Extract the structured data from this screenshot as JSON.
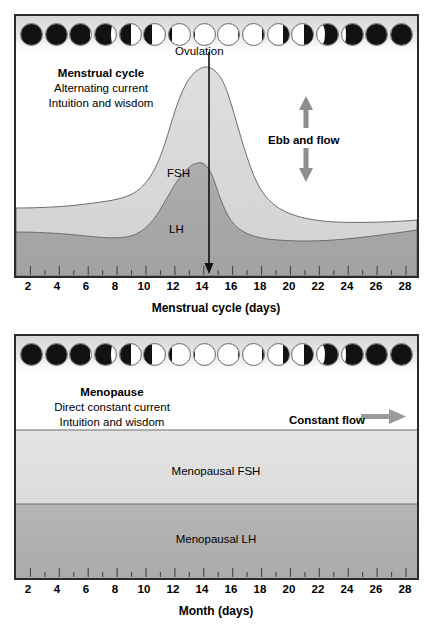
{
  "chart_data": [
    {
      "type": "area",
      "id": "menstrual-cycle",
      "title": "Menstrual cycle",
      "subtitle_lines": [
        "Alternating current",
        "Intuition and wisdom"
      ],
      "xlabel": "Menstrual cycle (days)",
      "ylabel": "",
      "xlim": [
        1,
        28
      ],
      "xticks": [
        2,
        4,
        6,
        8,
        10,
        12,
        14,
        16,
        18,
        20,
        22,
        24,
        26,
        28
      ],
      "grid": false,
      "legend_position": "inline-annotation",
      "annotations": [
        {
          "text": "Ovulation",
          "x": 14,
          "note": "vertical arrow down to axis at day 14"
        },
        {
          "text": "Ebb and flow",
          "note": "double-headed vertical arrow, up and down"
        },
        {
          "text": "FSH",
          "series": "FSH"
        },
        {
          "text": "LH",
          "series": "LH"
        }
      ],
      "series": [
        {
          "name": "FSH",
          "color": "#d9d9d9",
          "x": [
            1,
            2,
            3,
            4,
            5,
            6,
            7,
            8,
            9,
            10,
            11,
            12,
            13,
            14,
            15,
            16,
            17,
            18,
            19,
            20,
            21,
            22,
            23,
            24,
            25,
            26,
            27,
            28
          ],
          "values": [
            30,
            30,
            30,
            30,
            30,
            30,
            31,
            32,
            34,
            40,
            55,
            76,
            92,
            96,
            88,
            68,
            50,
            41,
            36,
            33,
            31,
            30,
            29,
            29,
            28,
            28,
            29,
            30
          ]
        },
        {
          "name": "LH",
          "color": "#a8a8a8",
          "x": [
            1,
            2,
            3,
            4,
            5,
            6,
            7,
            8,
            9,
            10,
            11,
            12,
            13,
            14,
            15,
            16,
            17,
            18,
            19,
            20,
            21,
            22,
            23,
            24,
            25,
            26,
            27,
            28
          ],
          "values": [
            17,
            17,
            17,
            17,
            16,
            16,
            15,
            14,
            14,
            16,
            21,
            32,
            44,
            43,
            32,
            24,
            20,
            18,
            17,
            16,
            16,
            16,
            17,
            17,
            18,
            19,
            21,
            23
          ]
        }
      ],
      "moon_phases": [
        {
          "index": 1,
          "name": "new-moon",
          "illumination": 0.0,
          "waxing": true
        },
        {
          "index": 2,
          "name": "new-moon",
          "illumination": 0.02,
          "waxing": true
        },
        {
          "index": 3,
          "name": "waxing-crescent",
          "illumination": 0.1,
          "waxing": true
        },
        {
          "index": 4,
          "name": "waxing-crescent",
          "illumination": 0.28,
          "waxing": true
        },
        {
          "index": 5,
          "name": "first-quarter",
          "illumination": 0.5,
          "waxing": true
        },
        {
          "index": 6,
          "name": "waxing-gibbous",
          "illumination": 0.7,
          "waxing": true
        },
        {
          "index": 7,
          "name": "waxing-gibbous",
          "illumination": 0.88,
          "waxing": true
        },
        {
          "index": 8,
          "name": "full-moon",
          "illumination": 1.0,
          "waxing": true
        },
        {
          "index": 9,
          "name": "full-moon",
          "illumination": 1.0,
          "waxing": false
        },
        {
          "index": 10,
          "name": "waning-gibbous",
          "illumination": 0.95,
          "waxing": false
        },
        {
          "index": 11,
          "name": "waning-gibbous",
          "illumination": 0.8,
          "waxing": false
        },
        {
          "index": 12,
          "name": "waning-gibbous",
          "illumination": 0.62,
          "waxing": false
        },
        {
          "index": 13,
          "name": "last-quarter",
          "illumination": 0.45,
          "waxing": false
        },
        {
          "index": 14,
          "name": "waning-crescent",
          "illumination": 0.25,
          "waxing": false
        },
        {
          "index": 15,
          "name": "new-moon",
          "illumination": 0.04,
          "waxing": false
        },
        {
          "index": 16,
          "name": "new-moon",
          "illumination": 0.0,
          "waxing": false
        }
      ]
    },
    {
      "type": "area",
      "id": "menopause",
      "title": "Menopause",
      "subtitle_lines": [
        "Direct constant current",
        "Intuition and wisdom"
      ],
      "xlabel": "Month (days)",
      "ylabel": "",
      "xlim": [
        1,
        28
      ],
      "xticks": [
        2,
        4,
        6,
        8,
        10,
        12,
        14,
        16,
        18,
        20,
        22,
        24,
        26,
        28
      ],
      "grid": false,
      "legend_position": "inline-annotation",
      "annotations": [
        {
          "text": "Constant flow",
          "note": "horizontal right-pointing arrow"
        },
        {
          "text": "Menopausal FSH",
          "series": "Menopausal FSH"
        },
        {
          "text": "Menopausal LH",
          "series": "Menopausal LH"
        }
      ],
      "series": [
        {
          "name": "Menopausal FSH",
          "color": "#e0e0e0",
          "constant": 72,
          "x": [
            1,
            2,
            3,
            4,
            5,
            6,
            7,
            8,
            9,
            10,
            11,
            12,
            13,
            14,
            15,
            16,
            17,
            18,
            19,
            20,
            21,
            22,
            23,
            24,
            25,
            26,
            27,
            28
          ],
          "values": [
            72,
            72,
            72,
            72,
            72,
            72,
            72,
            72,
            72,
            72,
            72,
            72,
            72,
            72,
            72,
            72,
            72,
            72,
            72,
            72,
            72,
            72,
            72,
            72,
            72,
            72,
            72,
            72
          ]
        },
        {
          "name": "Menopausal LH",
          "color": "#b0b0b0",
          "constant": 38,
          "x": [
            1,
            2,
            3,
            4,
            5,
            6,
            7,
            8,
            9,
            10,
            11,
            12,
            13,
            14,
            15,
            16,
            17,
            18,
            19,
            20,
            21,
            22,
            23,
            24,
            25,
            26,
            27,
            28
          ],
          "values": [
            38,
            38,
            38,
            38,
            38,
            38,
            38,
            38,
            38,
            38,
            38,
            38,
            38,
            38,
            38,
            38,
            38,
            38,
            38,
            38,
            38,
            38,
            38,
            38,
            38,
            38,
            38,
            38
          ]
        }
      ],
      "moon_phases": [
        {
          "index": 1,
          "name": "new-moon",
          "illumination": 0.0,
          "waxing": true
        },
        {
          "index": 2,
          "name": "new-moon",
          "illumination": 0.02,
          "waxing": true
        },
        {
          "index": 3,
          "name": "waxing-crescent",
          "illumination": 0.1,
          "waxing": true
        },
        {
          "index": 4,
          "name": "waxing-crescent",
          "illumination": 0.28,
          "waxing": true
        },
        {
          "index": 5,
          "name": "first-quarter",
          "illumination": 0.5,
          "waxing": true
        },
        {
          "index": 6,
          "name": "waxing-gibbous",
          "illumination": 0.7,
          "waxing": true
        },
        {
          "index": 7,
          "name": "waxing-gibbous",
          "illumination": 0.88,
          "waxing": true
        },
        {
          "index": 8,
          "name": "full-moon",
          "illumination": 1.0,
          "waxing": true
        },
        {
          "index": 9,
          "name": "full-moon",
          "illumination": 1.0,
          "waxing": false
        },
        {
          "index": 10,
          "name": "waning-gibbous",
          "illumination": 0.95,
          "waxing": false
        },
        {
          "index": 11,
          "name": "waning-gibbous",
          "illumination": 0.8,
          "waxing": false
        },
        {
          "index": 12,
          "name": "waning-gibbous",
          "illumination": 0.62,
          "waxing": false
        },
        {
          "index": 13,
          "name": "last-quarter",
          "illumination": 0.45,
          "waxing": false
        },
        {
          "index": 14,
          "name": "waning-crescent",
          "illumination": 0.25,
          "waxing": false
        },
        {
          "index": 15,
          "name": "new-moon",
          "illumination": 0.04,
          "waxing": false
        },
        {
          "index": 16,
          "name": "new-moon",
          "illumination": 0.0,
          "waxing": false
        }
      ]
    }
  ],
  "cycle_panel": {
    "caption_title": "Menstrual cycle",
    "caption_line2": "Alternating current",
    "caption_line3": "Intuition and wisdom",
    "ovulation_label": "Ovulation",
    "ebb_label": "Ebb and flow",
    "fsh_label": "FSH",
    "lh_label": "LH",
    "axis_title": "Menstrual cycle (days)",
    "axis_ticks": [
      "2",
      "4",
      "6",
      "8",
      "10",
      "12",
      "14",
      "16",
      "18",
      "20",
      "22",
      "24",
      "26",
      "28"
    ]
  },
  "menopause_panel": {
    "caption_title": "Menopause",
    "caption_line2": "Direct constant current",
    "caption_line3": "Intuition and wisdom",
    "constant_flow_label": "Constant flow",
    "fsh_band_label": "Menopausal FSH",
    "lh_band_label": "Menopausal LH",
    "axis_title": "Month (days)",
    "axis_ticks": [
      "2",
      "4",
      "6",
      "8",
      "10",
      "12",
      "14",
      "16",
      "18",
      "20",
      "22",
      "24",
      "26",
      "28"
    ]
  },
  "colors": {
    "fsh_fill": "#d9d9d9",
    "lh_fill": "#a8a8a8",
    "meno_fsh_fill": "#e0e0e0",
    "meno_lh_fill": "#b0b0b0",
    "frame": "#2b2b2b",
    "curve_stroke": "#6d6d6d",
    "arrow": "#8e8e8e",
    "moon_dark": "#121212",
    "moon_light": "#ffffff"
  }
}
